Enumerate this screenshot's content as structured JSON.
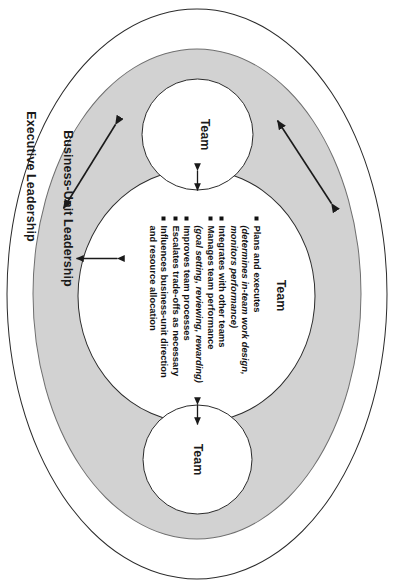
{
  "diagram": {
    "title_bands": {
      "outer_label": "Executive Leadership",
      "middle_label": "Business-Unit Leadership"
    },
    "team_nodes": [
      {
        "id": "team-top",
        "label": "Team"
      },
      {
        "id": "team-bottom",
        "label": "Team"
      },
      {
        "id": "team-center",
        "label": "Team"
      }
    ],
    "center_team_label": "Team",
    "responsibilities": [
      {
        "main": "Plans and executes",
        "sub": "(determines in-team work design,",
        "cont": "monitors performance)"
      },
      {
        "main": "Integrates with other teams",
        "sub": "",
        "cont": ""
      },
      {
        "main": "Manages team performance",
        "sub": "(goal setting, reviewing, rewarding)",
        "cont": ""
      },
      {
        "main": "Improves team processes",
        "sub": "",
        "cont": ""
      },
      {
        "main": "Escalates trade-offs as necessary",
        "sub": "",
        "cont": ""
      },
      {
        "main": "Influences business-unit direction",
        "sub": "",
        "cont": "and resource allocation"
      }
    ],
    "connectors": [
      {
        "name": "team-top-to-center",
        "style": "double-headed-arrow"
      },
      {
        "name": "team-bottom-to-center",
        "style": "double-headed-arrow"
      },
      {
        "name": "center-to-business-unit-band",
        "style": "double-headed-arrow"
      },
      {
        "name": "upper-diagonal-link",
        "style": "double-headed-arrow"
      },
      {
        "name": "lower-diagonal-link",
        "style": "double-headed-arrow"
      }
    ],
    "colors": {
      "band_fill": "#d2d2d2",
      "circle_fill": "#ffffff",
      "line": "#2b2b2b",
      "text": "#1a1a1a"
    }
  }
}
